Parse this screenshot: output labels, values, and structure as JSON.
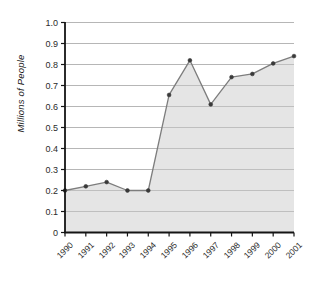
{
  "chart_data": {
    "type": "area",
    "title": "",
    "xlabel": "",
    "ylabel": "Millions of People",
    "categories": [
      "1990",
      "1991",
      "1992",
      "1993",
      "1994",
      "1995",
      "1996",
      "1997",
      "1998",
      "1999",
      "2000",
      "2001"
    ],
    "values": [
      0.2,
      0.22,
      0.24,
      0.2,
      0.2,
      0.655,
      0.82,
      0.61,
      0.74,
      0.755,
      0.805,
      0.84
    ],
    "series": [
      {
        "name": "Millions of People",
        "values": [
          0.2,
          0.22,
          0.24,
          0.2,
          0.2,
          0.655,
          0.82,
          0.61,
          0.74,
          0.755,
          0.805,
          0.84
        ]
      }
    ],
    "ylim": [
      0,
      1.0
    ],
    "ytick_step": 0.1,
    "ytick_labels": [
      "1.0",
      "0.9",
      "0.8",
      "0.7",
      "0.6",
      "0.5",
      "0.4",
      "0.3",
      "0.2",
      "0.1",
      "0"
    ],
    "ytick_values": [
      1.0,
      0.9,
      0.8,
      0.7,
      0.6,
      0.5,
      0.4,
      0.3,
      0.2,
      0.1,
      0
    ],
    "grid": "horizontal",
    "legend": "none",
    "marker": "circle",
    "colors": {
      "area_fill": "#e4e4e4",
      "line": "#7d7d7d",
      "marker": "#3a3a3a",
      "gridline": "#b4b4b4",
      "axis": "#141414",
      "background": "#ffffff",
      "text": "#2b2b2b"
    }
  }
}
